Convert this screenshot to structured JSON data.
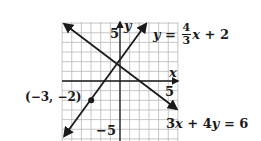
{
  "chart_data": {
    "type": "line",
    "title": "",
    "xlabel": "x",
    "ylabel": "y",
    "xlim": [
      -6,
      6
    ],
    "ylim": [
      -6,
      6
    ],
    "grid": true,
    "tick_labels": {
      "x": [
        "5"
      ],
      "y": [
        "5",
        "-5"
      ]
    },
    "series": [
      {
        "name": "y = 4/3 x + 2",
        "slope": 1.3333,
        "intercept": 2,
        "x": [
          -5.8,
          2.7
        ],
        "y": [
          -5.73,
          5.6
        ],
        "arrows": "both"
      },
      {
        "name": "3x + 4y = 6",
        "slope": -0.75,
        "intercept": 1.5,
        "x": [
          -5.8,
          5.9
        ],
        "y": [
          5.85,
          -2.93
        ],
        "arrows": "both"
      }
    ],
    "points": [
      {
        "x": -3,
        "y": -2,
        "label": "(−3, −2)"
      }
    ],
    "annotations": [
      "y = 4/3 x + 2",
      "3x + 4y = 6",
      "(−3, −2)"
    ]
  },
  "labels": {
    "y_axis": "y",
    "x_axis": "x",
    "y_tick_pos": "5",
    "y_tick_neg": "−5",
    "x_tick_pos": "5",
    "point": "(−3, −2)",
    "line1": {
      "lhs": "y",
      "eq": " = ",
      "num": "4",
      "den": "3",
      "rest_var": "x",
      "rest": " + 2"
    },
    "line2": {
      "text_a": "3",
      "var_x": "x",
      "text_b": " + 4",
      "var_y": "y",
      "text_c": " = 6"
    }
  },
  "colors": {
    "ink": "#1a1a1a",
    "grid": "#b8b8b8",
    "background": "#ffffff"
  }
}
